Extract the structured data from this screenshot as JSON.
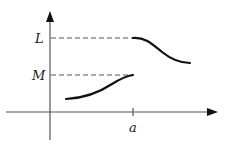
{
  "figure": {
    "type": "function-graph-with-jump-discontinuity",
    "axes": {
      "x_arrow": true,
      "y_arrow": true
    },
    "labels": {
      "L": "L",
      "M": "M",
      "a": "a"
    },
    "colors": {
      "axis": "#555555",
      "curve": "#111111",
      "dash": "#555555"
    }
  }
}
